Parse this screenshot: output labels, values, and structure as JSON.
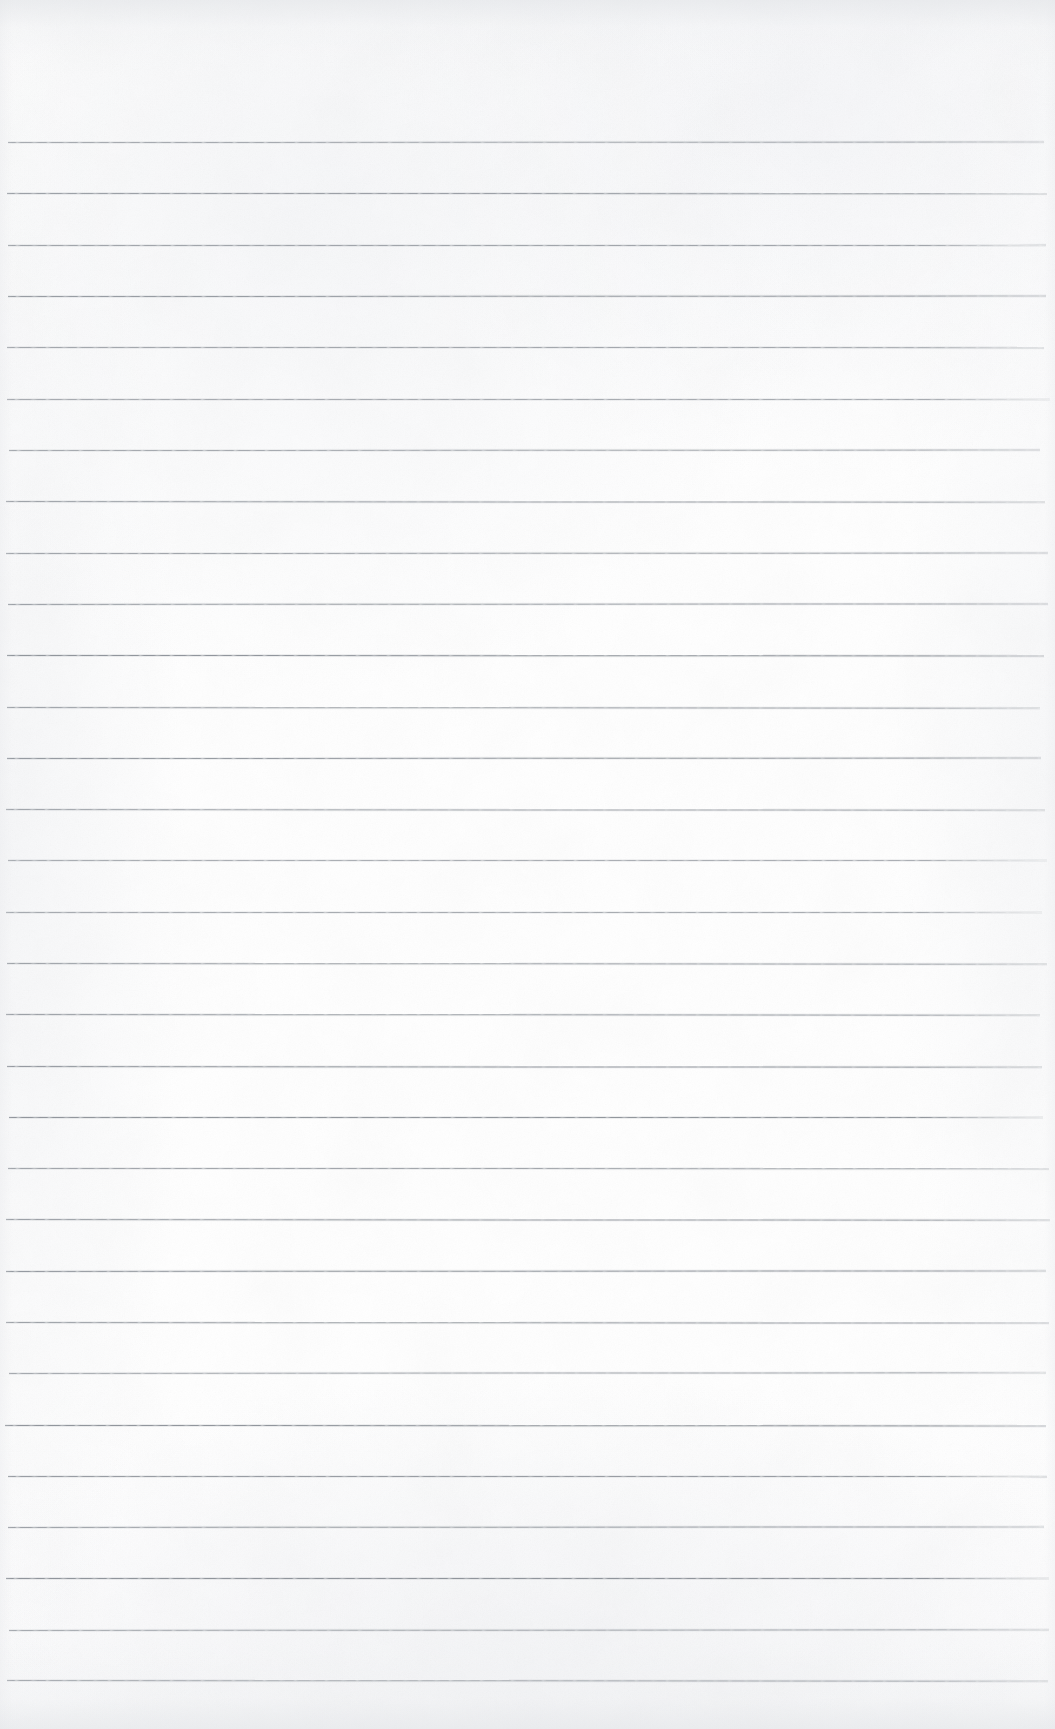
{
  "document": {
    "kind": "lined-notebook-paper-scan",
    "title": "Blank ruled notebook page",
    "written_content": "",
    "handwriting_present": "no",
    "printed_text_present": "no",
    "page_number_text": "",
    "header_text": "",
    "footer_text": ""
  },
  "page": {
    "width_px": 1055,
    "height_px": 1729,
    "background_color": "#fdfdfd",
    "paper_tone_color": "#ffffff",
    "edge_shadow_color": "#e4e6e9",
    "orientation": "portrait"
  },
  "ruling": {
    "style": "horizontal-ruled",
    "line_color": "#8d9299",
    "line_thickness_px": 1,
    "line_count": 31,
    "first_line_y_px": 142,
    "last_line_y_px": 1680,
    "line_spacing_px": 51.3,
    "line_start_x_px": 5,
    "line_end_x_px": 1050,
    "vertical_margin_rule": "none",
    "margin_rule_color": "",
    "top_margin_px": 142,
    "bottom_margin_px": 49,
    "line_y_positions": [
      142,
      193,
      245,
      296,
      347,
      399,
      450,
      501,
      553,
      604,
      655,
      707,
      758,
      809,
      860,
      912,
      963,
      1014,
      1066,
      1117,
      1168,
      1219,
      1271,
      1322,
      1373,
      1425,
      1476,
      1527,
      1578,
      1630,
      1680
    ]
  }
}
